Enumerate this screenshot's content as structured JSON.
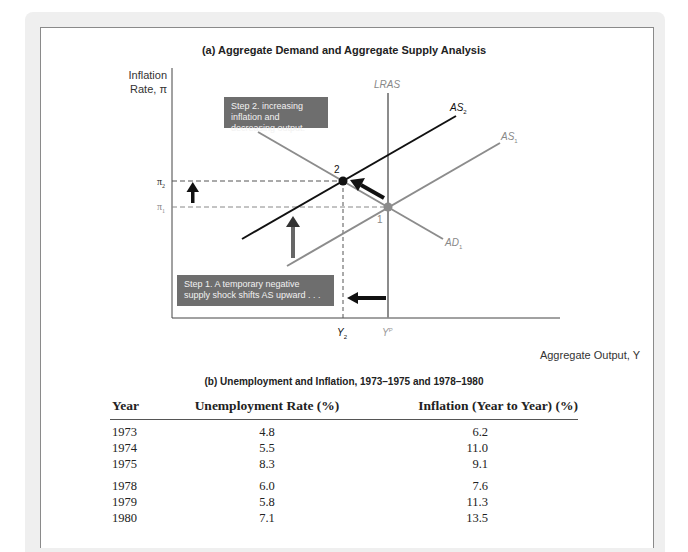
{
  "panel_a": {
    "title": "(a) Aggregate Demand and Aggregate Supply Analysis",
    "y_axis_label_line1": "Inflation",
    "y_axis_label_line2": "Rate, π",
    "x_axis_label": "Aggregate Output, Y",
    "curves": {
      "lras": "LRAS",
      "as2": "AS",
      "as2_sub": "2",
      "as1": "AS",
      "as1_sub": "1",
      "ad1": "AD",
      "ad1_sub": "1"
    },
    "points": {
      "p1": "1",
      "p2": "2"
    },
    "y_ticks": {
      "pi2": "π",
      "pi2_sub": "2",
      "pi1": "π",
      "pi1_sub": "1"
    },
    "x_ticks": {
      "y2": "Y",
      "y2_sub": "2",
      "yp": "Y",
      "yp_sup": "P"
    },
    "step1": "Step 1. A temporary negative supply shock shifts AS upward . . .",
    "step2": "Step 2. increasing inflation and decreasing output.",
    "colors": {
      "dark_curve": "#111111",
      "gray_curve": "#8c8c8c",
      "box_fill": "#6e6e6e"
    }
  },
  "panel_b": {
    "title": "(b) Unemployment and Inflation, 1973–1975 and 1978–1980",
    "headers": [
      "Year",
      "Unemployment Rate (%)",
      "Inflation (Year to Year) (%)"
    ],
    "rows": [
      [
        "1973",
        "4.8",
        "6.2"
      ],
      [
        "1974",
        "5.5",
        "11.0"
      ],
      [
        "1975",
        "8.3",
        "9.1"
      ],
      [
        "1978",
        "6.0",
        "7.6"
      ],
      [
        "1979",
        "5.8",
        "11.3"
      ],
      [
        "1980",
        "7.1",
        "13.5"
      ]
    ]
  }
}
